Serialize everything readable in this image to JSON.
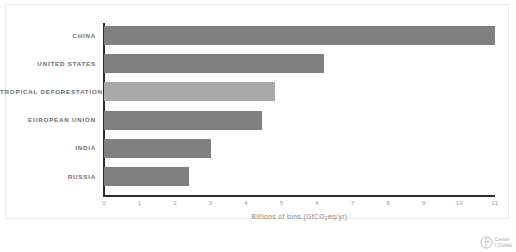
{
  "chart_data": {
    "type": "bar",
    "orientation": "horizontal",
    "title": "",
    "subtitle": "",
    "xlabel": "Billions of tons (GtCO2eq/yr)",
    "xlabel_parts": {
      "before": "Billions of tons (GtCO",
      "sub": "2",
      "after": "eq/yr)"
    },
    "ylabel": "",
    "categories": [
      "CHINA",
      "UNITED STATES",
      "TROPICAL DEFORESTATION",
      "EUROPEAN UNION",
      "INDIA",
      "RUSSIA"
    ],
    "values": [
      11.0,
      6.2,
      4.8,
      4.45,
      3.0,
      2.4
    ],
    "bar_styles": [
      "normal",
      "normal",
      "highlight",
      "normal",
      "normal",
      "normal"
    ],
    "xlim": [
      0,
      11
    ],
    "xticks": [
      0,
      1,
      2,
      3,
      4,
      5,
      6,
      7,
      8,
      9,
      10,
      11
    ],
    "xtick_labels": [
      "0",
      "1",
      "2",
      "3",
      "4",
      "5",
      "6",
      "7",
      "8",
      "9",
      "10",
      "11"
    ],
    "grid": false,
    "legend": "none",
    "colors": {
      "bar": "#808080",
      "bar_highlight": "#a9a9a9",
      "axis": "#2b2b2b",
      "tick_text": "#9a9a9a",
      "label_text": "#6e6e6e",
      "background": "#ffffff",
      "frame": "#ececec"
    }
  },
  "logo": {
    "icon": "center-for-global-development-logo-icon",
    "line1": "Center",
    "line2": "f Global"
  }
}
